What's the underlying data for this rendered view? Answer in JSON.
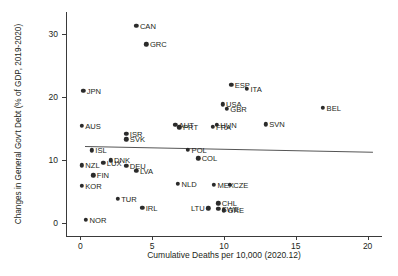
{
  "chart_data": {
    "type": "scatter",
    "title": "",
    "xlabel": "Cumulative Deaths per 10,000 (2020.12)",
    "ylabel": "Changes in General Gov't Debt (% of GDP, 2019-2020)",
    "xlim": [
      -1.0,
      21.0
    ],
    "ylim": [
      -2.0,
      33.5
    ],
    "xticks": [
      0,
      5,
      10,
      15,
      20
    ],
    "yticks": [
      0,
      10,
      20,
      30
    ],
    "grid": false,
    "legend": false,
    "point_label_field": "country",
    "points": [
      {
        "country": "CAN",
        "x": 3.9,
        "y": 31.3,
        "label_side": "right"
      },
      {
        "country": "GRC",
        "x": 4.6,
        "y": 28.4,
        "label_side": "right"
      },
      {
        "country": "JPN",
        "x": 0.2,
        "y": 21.0,
        "label_side": "right"
      },
      {
        "country": "ESP",
        "x": 10.5,
        "y": 22.0,
        "label_side": "right"
      },
      {
        "country": "ITA",
        "x": 11.6,
        "y": 21.3,
        "label_side": "right"
      },
      {
        "country": "AUS",
        "x": 0.1,
        "y": 15.5,
        "label_side": "right"
      },
      {
        "country": "USA",
        "x": 9.9,
        "y": 18.9,
        "label_side": "right"
      },
      {
        "country": "GBR",
        "x": 10.2,
        "y": 18.2,
        "label_side": "right"
      },
      {
        "country": "BEL",
        "x": 16.9,
        "y": 18.3,
        "label_side": "right"
      },
      {
        "country": "SVN",
        "x": 12.9,
        "y": 15.7,
        "label_side": "right"
      },
      {
        "country": "HUN",
        "x": 9.5,
        "y": 15.6,
        "label_side": "right"
      },
      {
        "country": "FRA",
        "x": 9.2,
        "y": 15.3,
        "label_side": "right"
      },
      {
        "country": "AUT",
        "x": 6.6,
        "y": 15.6,
        "label_side": "right"
      },
      {
        "country": "PRT",
        "x": 6.9,
        "y": 15.2,
        "label_side": "right"
      },
      {
        "country": "ISR",
        "x": 3.2,
        "y": 14.2,
        "label_side": "right"
      },
      {
        "country": "SVK",
        "x": 3.2,
        "y": 13.3,
        "label_side": "right"
      },
      {
        "country": "ISL",
        "x": 0.8,
        "y": 11.6,
        "label_side": "right"
      },
      {
        "country": "POL",
        "x": 7.5,
        "y": 11.7,
        "label_side": "right"
      },
      {
        "country": "COL",
        "x": 8.2,
        "y": 10.3,
        "label_side": "right"
      },
      {
        "country": "DNK",
        "x": 2.1,
        "y": 10.0,
        "label_side": "right"
      },
      {
        "country": "LUX",
        "x": 1.6,
        "y": 9.6,
        "label_side": "right"
      },
      {
        "country": "DEU",
        "x": 3.2,
        "y": 9.1,
        "label_side": "right"
      },
      {
        "country": "NZL",
        "x": 0.1,
        "y": 9.2,
        "label_side": "right"
      },
      {
        "country": "LVA",
        "x": 3.9,
        "y": 8.3,
        "label_side": "right"
      },
      {
        "country": "FIN",
        "x": 0.9,
        "y": 7.6,
        "label_side": "right"
      },
      {
        "country": "KOR",
        "x": 0.1,
        "y": 6.0,
        "label_side": "right"
      },
      {
        "country": "NLD",
        "x": 6.8,
        "y": 6.3,
        "label_side": "right"
      },
      {
        "country": "MEX",
        "x": 9.3,
        "y": 6.1,
        "label_side": "right"
      },
      {
        "country": "CZE",
        "x": 10.4,
        "y": 6.1,
        "label_side": "right"
      },
      {
        "country": "TUR",
        "x": 2.6,
        "y": 3.9,
        "label_side": "right"
      },
      {
        "country": "IRL",
        "x": 4.3,
        "y": 2.5,
        "label_side": "right"
      },
      {
        "country": "CHL",
        "x": 9.6,
        "y": 3.2,
        "label_side": "right"
      },
      {
        "country": "SWE",
        "x": 9.6,
        "y": 2.3,
        "label_side": "right"
      },
      {
        "country": "GRE",
        "x": 10.0,
        "y": 2.1,
        "label_side": "right"
      },
      {
        "country": "LTU",
        "x": 8.9,
        "y": 2.4,
        "label_side": "left"
      },
      {
        "country": "NOR",
        "x": 0.4,
        "y": 0.6,
        "label_side": "right"
      }
    ],
    "fit_line": {
      "x_start": 0.35,
      "y_start": 12.2,
      "x_end": 20.4,
      "y_end": 11.3
    }
  }
}
